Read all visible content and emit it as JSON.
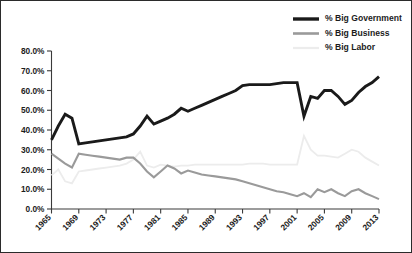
{
  "chart_data": {
    "type": "line",
    "title": "",
    "subtitle": "",
    "xlabel": "",
    "ylabel": "",
    "grid": false,
    "legend_position": "top-right",
    "xlim": [
      1965,
      2013
    ],
    "ylim": [
      0,
      80
    ],
    "y_tick_labels": [
      "0.0%",
      "10.0%",
      "20.0%",
      "30.0%",
      "40.0%",
      "50.0%",
      "60.0%",
      "70.0%",
      "80.0%"
    ],
    "y_tick_values": [
      0,
      10,
      20,
      30,
      40,
      50,
      60,
      70,
      80
    ],
    "x_tick_labels": [
      "1965",
      "1969",
      "1973",
      "1977",
      "1981",
      "1985",
      "1989",
      "1993",
      "1997",
      "2001",
      "2005",
      "2009",
      "2013"
    ],
    "x_tick_values": [
      1965,
      1969,
      1973,
      1977,
      1981,
      1985,
      1989,
      1993,
      1997,
      2001,
      2005,
      2009,
      2013
    ],
    "x": [
      1965,
      1966,
      1967,
      1968,
      1969,
      1970,
      1971,
      1972,
      1973,
      1974,
      1975,
      1976,
      1977,
      1978,
      1979,
      1980,
      1981,
      1982,
      1983,
      1984,
      1985,
      1986,
      1987,
      1988,
      1989,
      1990,
      1991,
      1992,
      1993,
      1994,
      1995,
      1996,
      1997,
      1998,
      1999,
      2000,
      2001,
      2002,
      2003,
      2004,
      2005,
      2006,
      2007,
      2008,
      2009,
      2010,
      2011,
      2012,
      2013
    ],
    "series": [
      {
        "name": "% Big Government",
        "color": "#1a1a1a",
        "values": [
          35,
          42,
          48,
          46,
          33,
          33.5,
          34,
          34.5,
          35,
          35.5,
          36,
          36.5,
          38,
          42,
          47,
          43,
          44.5,
          46,
          48,
          51,
          49.5,
          51,
          52.5,
          54,
          55.5,
          57,
          58.5,
          60,
          62.5,
          63,
          63,
          63,
          63,
          63.5,
          64,
          64,
          64,
          47,
          57,
          56,
          60,
          60,
          57,
          53,
          55,
          59,
          62,
          64,
          67
        ]
      },
      {
        "name": "% Big Business",
        "color": "#9a9a9a",
        "values": [
          28,
          25.5,
          23,
          21,
          28,
          27.5,
          27,
          26.5,
          26,
          25.5,
          25,
          26,
          26,
          23,
          19,
          16,
          19,
          22,
          20.5,
          18,
          19.5,
          18.5,
          17.5,
          17,
          16.5,
          16,
          15.5,
          15,
          14,
          13,
          12,
          11,
          10,
          9,
          8.5,
          7.5,
          6.5,
          8,
          6,
          10,
          8.5,
          10,
          8,
          6.5,
          9,
          10,
          8,
          6.5,
          5
        ]
      },
      {
        "name": "% Big Labor",
        "color": "#ececec",
        "values": [
          17,
          20,
          14,
          13,
          19,
          19.5,
          20,
          20.5,
          21,
          21.5,
          22,
          23,
          25,
          29,
          22,
          21,
          22.5,
          22,
          21.5,
          22,
          22,
          22.5,
          22.5,
          22.5,
          22.5,
          22.5,
          22.5,
          22.5,
          22.5,
          23,
          23,
          23,
          22.5,
          22.5,
          22.5,
          22.5,
          22.5,
          37,
          30,
          27,
          27,
          26.5,
          26,
          28,
          30,
          29,
          26,
          24,
          22
        ]
      }
    ]
  },
  "legend": {
    "items": [
      {
        "label": "% Big Government",
        "color": "#1a1a1a",
        "width": 3.4
      },
      {
        "label": "% Big Business",
        "color": "#9a9a9a",
        "width": 2.6
      },
      {
        "label": "% Big Labor",
        "color": "#ececec",
        "width": 2.2
      }
    ]
  }
}
